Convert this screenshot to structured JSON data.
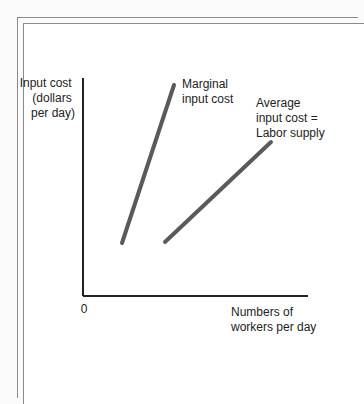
{
  "chart_data": {
    "type": "line",
    "title": "",
    "ylabel": [
      "Input cost",
      "(dollars",
      "per day)"
    ],
    "xlabel": [
      "Numbers of",
      "workers per day"
    ],
    "origin_label": "0",
    "axis_ticks": "none",
    "grid": false,
    "legend": "inline labels",
    "series": [
      {
        "name": "Marginal input cost",
        "label_lines": [
          "Marginal",
          "input cost"
        ],
        "points_px": [
          [
            122,
            243
          ],
          [
            174,
            85
          ]
        ],
        "color": "#5a5a5a"
      },
      {
        "name": "Average input cost = Labor supply",
        "label_lines": [
          "Average",
          "input cost =",
          "Labor supply"
        ],
        "points_px": [
          [
            165,
            242
          ],
          [
            271,
            142
          ]
        ],
        "color": "#5a5a5a"
      }
    ],
    "axes_px": {
      "origin": [
        83,
        296
      ],
      "y_top": 78,
      "x_right": 308
    }
  },
  "colors": {
    "axis": "#222222",
    "curve": "#5a5a5a",
    "frame": "#8a8a8a"
  }
}
